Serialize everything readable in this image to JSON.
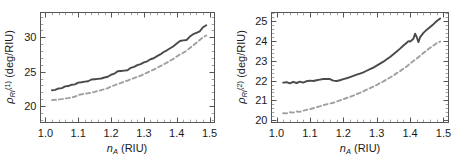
{
  "figure": {
    "background": "#ffffff",
    "solid_color": "#4a4a4a",
    "dashed_color": "#a0a0a0"
  },
  "chart_data": [
    {
      "type": "line",
      "panel": "left",
      "title": "",
      "xlabel": "n_A (RIU)",
      "xlabel_base": "n",
      "xlabel_sub": "A",
      "xlabel_unit": "(RIU)",
      "ylabel": "ρ_RI^(1) (deg/RIU)",
      "ylabel_base": "ρ",
      "ylabel_sub": "RI",
      "ylabel_sup": "(1)",
      "ylabel_unit": "(deg/RIU)",
      "xlim": [
        0.985,
        1.515
      ],
      "ylim": [
        17.6,
        33.6
      ],
      "xticks": [
        1.0,
        1.1,
        1.2,
        1.3,
        1.4,
        1.5
      ],
      "xticklabels": [
        "1.0",
        "1.1",
        "1.2",
        "1.3",
        "1.4",
        "1.5"
      ],
      "yticks": [
        20,
        25,
        30
      ],
      "yticklabels": [
        "20",
        "25",
        "30"
      ],
      "grid": false,
      "legend": "none",
      "series": [
        {
          "name": "solid",
          "style": "solid",
          "color": "#4a4a4a",
          "x": [
            1.02,
            1.03,
            1.04,
            1.05,
            1.06,
            1.07,
            1.08,
            1.09,
            1.1,
            1.11,
            1.12,
            1.13,
            1.14,
            1.15,
            1.16,
            1.17,
            1.18,
            1.19,
            1.2,
            1.21,
            1.22,
            1.23,
            1.24,
            1.25,
            1.26,
            1.27,
            1.28,
            1.29,
            1.3,
            1.31,
            1.32,
            1.33,
            1.34,
            1.35,
            1.36,
            1.37,
            1.38,
            1.39,
            1.4,
            1.41,
            1.42,
            1.43,
            1.44,
            1.45,
            1.46,
            1.47,
            1.48,
            1.49
          ],
          "y": [
            22.3,
            22.35,
            22.55,
            22.6,
            22.85,
            22.9,
            23.1,
            23.15,
            23.4,
            23.45,
            23.55,
            23.6,
            23.85,
            23.9,
            23.95,
            24.0,
            24.15,
            24.25,
            24.55,
            24.7,
            25.05,
            25.1,
            25.15,
            25.2,
            25.55,
            25.7,
            25.95,
            26.1,
            26.35,
            26.5,
            26.8,
            26.95,
            27.25,
            27.5,
            27.85,
            28.1,
            28.4,
            28.7,
            29.1,
            29.45,
            29.55,
            29.6,
            30.1,
            30.45,
            30.65,
            30.85,
            31.45,
            31.75
          ]
        },
        {
          "name": "dashed",
          "style": "dashed",
          "color": "#a0a0a0",
          "x": [
            1.02,
            1.03,
            1.04,
            1.05,
            1.06,
            1.07,
            1.08,
            1.09,
            1.1,
            1.11,
            1.12,
            1.13,
            1.14,
            1.15,
            1.16,
            1.17,
            1.18,
            1.19,
            1.2,
            1.21,
            1.22,
            1.23,
            1.24,
            1.25,
            1.26,
            1.27,
            1.28,
            1.29,
            1.3,
            1.31,
            1.32,
            1.33,
            1.34,
            1.35,
            1.36,
            1.37,
            1.38,
            1.39,
            1.4,
            1.41,
            1.42,
            1.43,
            1.44,
            1.45,
            1.46,
            1.47,
            1.48,
            1.49
          ],
          "y": [
            20.85,
            20.9,
            20.95,
            21.0,
            21.1,
            21.15,
            21.25,
            21.35,
            21.6,
            21.7,
            21.8,
            21.85,
            21.95,
            22.05,
            22.2,
            22.3,
            22.45,
            22.6,
            22.85,
            23.0,
            23.2,
            23.35,
            23.55,
            23.7,
            23.9,
            24.05,
            24.25,
            24.4,
            24.65,
            24.85,
            25.1,
            25.3,
            25.55,
            25.8,
            26.05,
            26.3,
            26.6,
            26.85,
            27.2,
            27.5,
            27.75,
            28.05,
            28.45,
            28.8,
            29.2,
            29.6,
            30.0,
            30.25
          ]
        }
      ]
    },
    {
      "type": "line",
      "panel": "right",
      "title": "",
      "xlabel": "n_A (RIU)",
      "xlabel_base": "n",
      "xlabel_sub": "A",
      "xlabel_unit": "(RIU)",
      "ylabel": "ρ_RI^(2) (deg/RIU)",
      "ylabel_base": "ρ",
      "ylabel_sub": "RI",
      "ylabel_sup": "(2)",
      "ylabel_unit": "(deg/RIU)",
      "xlim": [
        0.985,
        1.515
      ],
      "ylim": [
        19.88,
        25.45
      ],
      "xticks": [
        1.0,
        1.1,
        1.2,
        1.3,
        1.4,
        1.5
      ],
      "xticklabels": [
        "1.0",
        "1.1",
        "1.2",
        "1.3",
        "1.4",
        "1.5"
      ],
      "yticks": [
        20,
        21,
        22,
        23,
        24,
        25
      ],
      "yticklabels": [
        "20",
        "21",
        "22",
        "23",
        "24",
        "25"
      ],
      "grid": false,
      "legend": "none",
      "series": [
        {
          "name": "solid",
          "style": "solid",
          "color": "#4a4a4a",
          "x": [
            1.02,
            1.03,
            1.04,
            1.05,
            1.06,
            1.07,
            1.08,
            1.09,
            1.1,
            1.11,
            1.12,
            1.13,
            1.14,
            1.15,
            1.16,
            1.17,
            1.18,
            1.19,
            1.2,
            1.21,
            1.22,
            1.23,
            1.24,
            1.25,
            1.26,
            1.27,
            1.28,
            1.29,
            1.3,
            1.31,
            1.32,
            1.33,
            1.34,
            1.35,
            1.36,
            1.37,
            1.38,
            1.39,
            1.395,
            1.4,
            1.405,
            1.41,
            1.415,
            1.42,
            1.425,
            1.43,
            1.44,
            1.45,
            1.46,
            1.47,
            1.48,
            1.49
          ],
          "y": [
            21.9,
            21.92,
            21.86,
            21.94,
            21.88,
            21.95,
            21.9,
            21.97,
            22.0,
            21.98,
            22.02,
            22.05,
            22.08,
            22.08,
            22.08,
            22.0,
            21.98,
            22.02,
            22.08,
            22.12,
            22.18,
            22.24,
            22.3,
            22.36,
            22.42,
            22.5,
            22.58,
            22.66,
            22.76,
            22.86,
            22.96,
            23.08,
            23.2,
            23.34,
            23.48,
            23.62,
            23.78,
            23.92,
            24.0,
            23.98,
            24.05,
            24.12,
            24.38,
            24.2,
            23.95,
            24.2,
            24.42,
            24.58,
            24.72,
            24.86,
            25.02,
            25.15
          ]
        },
        {
          "name": "dashed",
          "style": "dashed",
          "color": "#a0a0a0",
          "x": [
            1.02,
            1.03,
            1.04,
            1.05,
            1.06,
            1.07,
            1.08,
            1.09,
            1.1,
            1.11,
            1.12,
            1.13,
            1.14,
            1.15,
            1.16,
            1.17,
            1.18,
            1.19,
            1.2,
            1.21,
            1.22,
            1.23,
            1.24,
            1.25,
            1.26,
            1.27,
            1.28,
            1.29,
            1.3,
            1.31,
            1.32,
            1.33,
            1.34,
            1.35,
            1.36,
            1.37,
            1.38,
            1.39,
            1.4,
            1.41,
            1.42,
            1.43,
            1.44,
            1.45,
            1.46,
            1.47,
            1.48,
            1.49
          ],
          "y": [
            20.35,
            20.34,
            20.4,
            20.38,
            20.44,
            20.42,
            20.48,
            20.52,
            20.56,
            20.6,
            20.66,
            20.7,
            20.76,
            20.8,
            20.84,
            20.88,
            20.94,
            21.0,
            21.06,
            21.12,
            21.18,
            21.24,
            21.32,
            21.38,
            21.46,
            21.54,
            21.62,
            21.7,
            21.78,
            21.88,
            21.96,
            22.06,
            22.16,
            22.26,
            22.38,
            22.48,
            22.6,
            22.72,
            22.86,
            23.0,
            23.12,
            23.26,
            23.4,
            23.54,
            23.66,
            23.78,
            23.9,
            23.98
          ]
        }
      ]
    }
  ]
}
